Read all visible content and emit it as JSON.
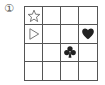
{
  "label": "①",
  "grid": {
    "rows": 4,
    "cols": 4,
    "symbols": [
      {
        "row": 0,
        "col": 0,
        "icon": "star-outline-icon"
      },
      {
        "row": 1,
        "col": 0,
        "icon": "triangle-right-outline-icon"
      },
      {
        "row": 1,
        "col": 3,
        "icon": "heart-icon"
      },
      {
        "row": 2,
        "col": 2,
        "icon": "club-icon"
      }
    ]
  },
  "colors": {
    "line": "#555555",
    "symbol": "#222222"
  }
}
